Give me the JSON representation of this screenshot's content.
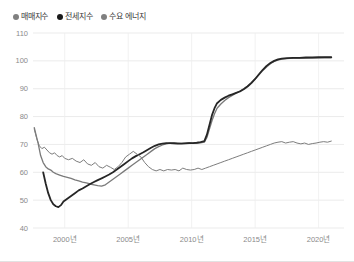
{
  "legend": {
    "items": [
      {
        "label": "매매지수",
        "color": "#808080",
        "icon": "legend-dot-icon"
      },
      {
        "label": "전세지수",
        "color": "#1a1a1a",
        "icon": "legend-dot-icon"
      },
      {
        "label": "수요 에너지",
        "color": "#808080",
        "icon": "legend-dot-icon"
      }
    ]
  },
  "chart_data": {
    "type": "line",
    "title": "",
    "subtitle": "",
    "xlabel": "",
    "ylabel": "",
    "grid": true,
    "legend_position": "top-left",
    "ylim": [
      40,
      110
    ],
    "xlim": [
      1997.5,
      2022.0
    ],
    "yticks": [
      40,
      50,
      60,
      70,
      80,
      90,
      100,
      110
    ],
    "ytick_labels": [
      "40",
      "50",
      "60",
      "70",
      "80",
      "90",
      "100",
      "110"
    ],
    "xticks": [
      2000,
      2005,
      2010,
      2015,
      2020
    ],
    "xtick_labels": [
      "2000년",
      "2005년",
      "2010년",
      "2015년",
      "2020년"
    ],
    "series": [
      {
        "name": "매매지수",
        "color": "#7a7a7a",
        "width": 1.3,
        "x": [
          1997.6,
          1997.9,
          1998.1,
          1998.3,
          1998.5,
          1998.7,
          1998.9,
          1999.1,
          1999.3,
          1999.6,
          1999.9,
          2000.2,
          2000.5,
          2000.8,
          2001.1,
          2001.4,
          2001.7,
          2002.0,
          2002.3,
          2002.6,
          2002.9,
          2003.2,
          2003.5,
          2003.8,
          2004.1,
          2004.4,
          2004.7,
          2005.0,
          2005.3,
          2005.6,
          2005.9,
          2006.2,
          2006.5,
          2006.8,
          2007.1,
          2007.4,
          2007.7,
          2008.0,
          2008.3,
          2008.6,
          2008.9,
          2009.2,
          2009.5,
          2009.8,
          2010.1,
          2010.4,
          2010.7,
          2011.0,
          2011.2,
          2011.4,
          2011.6,
          2011.8,
          2012.0,
          2012.3,
          2012.6,
          2012.9,
          2013.2,
          2013.5,
          2013.8,
          2014.1,
          2014.4,
          2014.7,
          2015.0,
          2015.3,
          2015.6,
          2015.9,
          2016.2,
          2016.5,
          2016.8,
          2017.1,
          2017.5,
          2018.0,
          2018.5,
          2019.0,
          2019.5,
          2020.0,
          2020.5,
          2021.0
        ],
        "y": [
          76.0,
          70.5,
          66.0,
          63.5,
          62.0,
          61.2,
          60.8,
          60.0,
          59.5,
          59.0,
          58.5,
          58.2,
          57.8,
          57.3,
          56.9,
          56.5,
          56.2,
          55.8,
          55.5,
          55.2,
          55.0,
          55.5,
          56.5,
          57.5,
          58.5,
          59.5,
          60.5,
          61.5,
          62.5,
          63.5,
          64.5,
          65.5,
          66.5,
          67.5,
          68.5,
          69.2,
          69.8,
          70.2,
          70.5,
          70.6,
          70.5,
          70.4,
          70.5,
          70.6,
          70.5,
          70.5,
          70.6,
          70.8,
          72.5,
          75.5,
          78.5,
          81.0,
          83.0,
          84.5,
          85.8,
          86.8,
          87.6,
          88.4,
          89.2,
          90.0,
          91.0,
          92.2,
          93.5,
          95.0,
          96.5,
          97.8,
          99.0,
          99.8,
          100.3,
          100.6,
          100.8,
          101.0,
          101.0,
          101.0,
          101.1,
          101.1,
          101.2,
          101.2
        ]
      },
      {
        "name": "전세지수",
        "color": "#262626",
        "width": 1.8,
        "x": [
          1998.3,
          1998.5,
          1998.7,
          1998.9,
          1999.1,
          1999.3,
          1999.5,
          1999.7,
          1999.9,
          2000.2,
          2000.5,
          2000.8,
          2001.1,
          2001.4,
          2001.7,
          2002.0,
          2002.3,
          2002.6,
          2002.9,
          2003.2,
          2003.5,
          2003.8,
          2004.1,
          2004.4,
          2004.7,
          2005.0,
          2005.3,
          2005.6,
          2005.9,
          2006.2,
          2006.5,
          2006.8,
          2007.1,
          2007.4,
          2007.7,
          2008.0,
          2008.3,
          2008.6,
          2008.9,
          2009.2,
          2009.5,
          2009.8,
          2010.1,
          2010.4,
          2010.7,
          2011.0,
          2011.2,
          2011.4,
          2011.6,
          2011.8,
          2012.0,
          2012.3,
          2012.6,
          2012.9,
          2013.2,
          2013.5,
          2013.8,
          2014.1,
          2014.4,
          2014.7,
          2015.0,
          2015.3,
          2015.6,
          2015.9,
          2016.2,
          2016.5,
          2016.8,
          2017.1,
          2017.5,
          2018.0,
          2018.5,
          2019.0,
          2019.5,
          2020.0,
          2020.5,
          2021.0
        ],
        "y": [
          60.0,
          56.0,
          52.5,
          50.0,
          48.5,
          47.8,
          47.5,
          48.2,
          49.5,
          50.5,
          51.5,
          52.5,
          53.5,
          54.2,
          55.0,
          55.8,
          56.5,
          57.2,
          57.8,
          58.5,
          59.2,
          60.0,
          61.0,
          62.0,
          63.0,
          64.0,
          65.0,
          65.8,
          66.5,
          67.2,
          68.0,
          68.8,
          69.5,
          70.0,
          70.3,
          70.5,
          70.5,
          70.4,
          70.3,
          70.3,
          70.4,
          70.5,
          70.5,
          70.6,
          70.8,
          71.2,
          73.5,
          77.0,
          80.5,
          83.0,
          84.8,
          86.0,
          86.8,
          87.5,
          88.0,
          88.5,
          89.0,
          89.8,
          90.8,
          92.0,
          93.5,
          95.2,
          96.8,
          98.2,
          99.2,
          100.0,
          100.5,
          100.8,
          101.0,
          101.1,
          101.1,
          101.2,
          101.2,
          101.3,
          101.3,
          101.3
        ]
      },
      {
        "name": "수요 에너지",
        "color": "#7d7d7d",
        "width": 1.0,
        "x": [
          1997.6,
          1997.8,
          1998.0,
          1998.2,
          1998.4,
          1998.6,
          1998.8,
          1999.0,
          1999.2,
          1999.4,
          1999.6,
          1999.8,
          2000.0,
          2000.3,
          2000.6,
          2000.9,
          2001.2,
          2001.5,
          2001.8,
          2002.1,
          2002.4,
          2002.7,
          2003.0,
          2003.3,
          2003.6,
          2003.9,
          2004.2,
          2004.5,
          2004.8,
          2005.1,
          2005.4,
          2005.7,
          2006.0,
          2006.3,
          2006.6,
          2006.9,
          2007.2,
          2007.5,
          2007.8,
          2008.1,
          2008.4,
          2008.7,
          2009.0,
          2009.3,
          2009.6,
          2009.9,
          2010.2,
          2010.5,
          2010.8,
          2011.1,
          2011.4,
          2011.7,
          2012.0,
          2012.3,
          2012.6,
          2012.9,
          2013.2,
          2013.5,
          2013.8,
          2014.1,
          2014.4,
          2014.7,
          2015.0,
          2015.3,
          2015.6,
          2015.9,
          2016.2,
          2016.5,
          2016.8,
          2017.1,
          2017.4,
          2017.7,
          2018.0,
          2018.3,
          2018.6,
          2018.9,
          2019.2,
          2019.5,
          2019.8,
          2020.1,
          2020.4,
          2020.7,
          2021.0
        ],
        "y": [
          75.5,
          72.0,
          69.5,
          68.5,
          69.0,
          68.0,
          67.0,
          66.5,
          67.0,
          66.0,
          65.5,
          66.0,
          65.0,
          64.5,
          65.0,
          64.0,
          63.5,
          64.5,
          63.0,
          62.5,
          63.5,
          62.0,
          61.5,
          62.5,
          61.8,
          61.0,
          62.0,
          63.5,
          65.5,
          66.5,
          67.5,
          66.5,
          65.5,
          63.5,
          62.0,
          61.0,
          60.5,
          61.0,
          60.5,
          61.0,
          60.8,
          61.0,
          60.5,
          61.5,
          61.0,
          60.8,
          61.0,
          61.5,
          61.0,
          61.5,
          62.0,
          62.5,
          63.0,
          63.5,
          64.0,
          64.5,
          65.0,
          65.5,
          66.0,
          66.5,
          67.0,
          67.5,
          68.0,
          68.5,
          69.0,
          69.5,
          70.0,
          70.5,
          70.8,
          71.0,
          70.5,
          70.8,
          71.0,
          70.5,
          70.2,
          70.5,
          70.0,
          70.3,
          70.5,
          70.8,
          71.0,
          70.8,
          71.2
        ]
      }
    ]
  }
}
